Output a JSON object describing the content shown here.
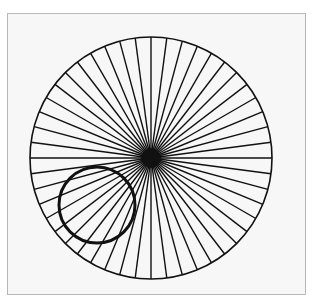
{
  "figure": {
    "colors": {
      "background": "#f7f7f7",
      "frame_border": "#b8b8b8",
      "stroke": "#111111"
    },
    "outer_circle": {
      "cx": 151,
      "cy": 158,
      "r": 121,
      "stroke_width": 1.6
    },
    "center_dot": {
      "cx": 151,
      "cy": 158,
      "r": 10
    },
    "spokes": {
      "count": 48,
      "stroke_width": 1.4
    },
    "overlay_circle": {
      "cx": 97,
      "cy": 205,
      "r": 38,
      "stroke_width": 3
    }
  }
}
